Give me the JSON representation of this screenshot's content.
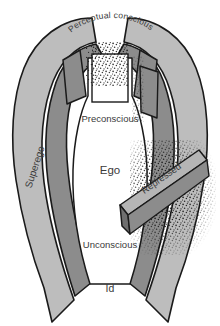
{
  "figure": {
    "name": "freud-structural-model-of-the-psyche",
    "background_color": "#ffffff"
  },
  "labels": {
    "perceptual_conscious": "Perceptual conscious",
    "preconscious": "Preconscious",
    "ego": "Ego",
    "superego": "Superego",
    "repressed": "Repressed",
    "unconscious": "Unconscious",
    "id": "Id"
  },
  "colors": {
    "outline": "#1a1a1a",
    "outer_band": "#bdbdbd",
    "inner_band": "#8c8c8c",
    "beam_top": "#b5b5b5",
    "beam_face": "#6f6f6f",
    "interior": "#ffffff",
    "label_text": "#3a3a3a",
    "stipple": "#111111"
  },
  "regions": [
    {
      "name": "perceptual-conscious-band",
      "label": "Perceptual conscious",
      "fill": "#bdbdbd"
    },
    {
      "name": "superego-band",
      "label": "Superego",
      "fill": "#8c8c8c"
    },
    {
      "name": "preconscious-area",
      "label": "Preconscious",
      "fill": "#ffffff"
    },
    {
      "name": "ego-area",
      "label": "Ego",
      "fill": "#ffffff"
    },
    {
      "name": "repressed-beam",
      "label": "Repressed",
      "fill": "#b5b5b5"
    },
    {
      "name": "unconscious-area",
      "label": "Unconscious",
      "fill": "#ffffff"
    },
    {
      "name": "id-area",
      "label": "Id",
      "fill": "#ffffff"
    }
  ]
}
